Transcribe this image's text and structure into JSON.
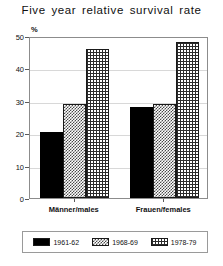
{
  "chart_data": {
    "type": "bar",
    "title": "Five year relative survival rate",
    "xlabel": "",
    "ylabel": "%",
    "ylim": [
      0,
      50
    ],
    "yticks": [
      0,
      10,
      20,
      30,
      40,
      50
    ],
    "grid": true,
    "legend_position": "bottom",
    "categories": [
      "Männer/males",
      "Frauen/females"
    ],
    "series": [
      {
        "name": "1961-62",
        "values": [
          20.5,
          28.0
        ],
        "swatch": "solid-black"
      },
      {
        "name": "1968-69",
        "values": [
          29.0,
          29.0
        ],
        "swatch": "light-checker"
      },
      {
        "name": "1978-79",
        "values": [
          46.0,
          48.0
        ],
        "swatch": "dark-checker"
      }
    ]
  },
  "colors": {
    "series_1961_62": "#000000",
    "series_1968_69": "#4a4a4a",
    "series_1978_79": "#2b2b2b",
    "frame": "#8c8c8c",
    "grid": "#d8d8d8",
    "text": "#111111"
  },
  "axis": {
    "unit_label": "%",
    "tick_labels": [
      "0",
      "10",
      "20",
      "30",
      "40",
      "50"
    ]
  }
}
